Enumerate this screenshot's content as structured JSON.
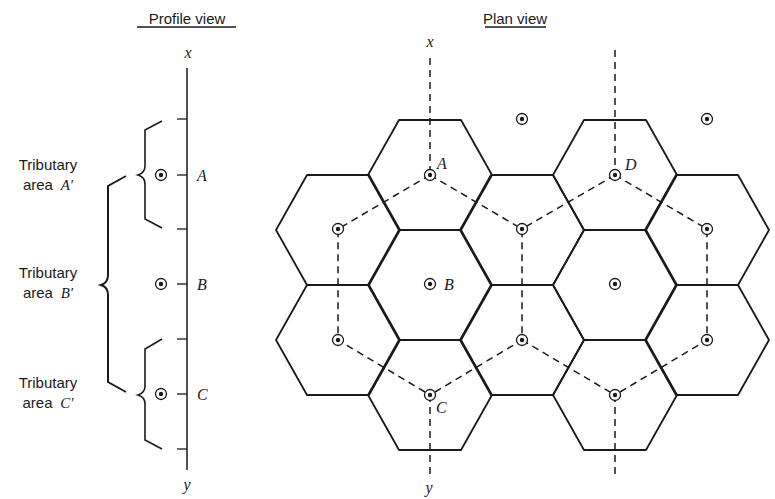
{
  "profile_view": {
    "title": "Profile view",
    "axis_top_label": "x",
    "axis_bottom_label": "y",
    "points": [
      {
        "label": "A",
        "y": 175
      },
      {
        "label": "B",
        "y": 284
      },
      {
        "label": "C",
        "y": 394
      }
    ],
    "tributary_areas": [
      {
        "line1": "Tributary",
        "line2_prefix": "area",
        "line2_label": "A′"
      },
      {
        "line1": "Tributary",
        "line2_prefix": "area",
        "line2_label": "B′"
      },
      {
        "line1": "Tributary",
        "line2_prefix": "area",
        "line2_label": "C′"
      }
    ]
  },
  "plan_view": {
    "title": "Plan view",
    "axis_top_label": "x",
    "axis_bottom_label": "y",
    "labeled_points": [
      {
        "label": "A"
      },
      {
        "label": "B"
      },
      {
        "label": "C"
      },
      {
        "label": "D"
      }
    ]
  },
  "colors": {
    "line": "#1a1a1a",
    "background": "#ffffff"
  }
}
